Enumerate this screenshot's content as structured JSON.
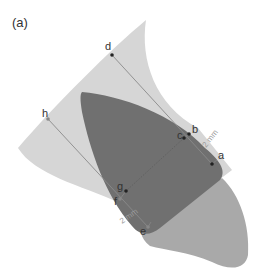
{
  "panel_label": "(a)",
  "colors": {
    "outer_region": "#d6d6d6",
    "inner_dark": "#707070",
    "lower_tip": "#a9a9a9",
    "line": "#8a8a8a",
    "point": "#222222",
    "text": "#333333",
    "dimension_text": "#9a9a9a"
  },
  "points": [
    {
      "id": "a",
      "label": "a"
    },
    {
      "id": "b",
      "label": "b"
    },
    {
      "id": "c",
      "label": "c"
    },
    {
      "id": "d",
      "label": "d"
    },
    {
      "id": "e",
      "label": "e"
    },
    {
      "id": "f",
      "label": "f"
    },
    {
      "id": "g",
      "label": "g"
    },
    {
      "id": "h",
      "label": "h"
    }
  ],
  "dimensions": [
    {
      "id": "upper",
      "label": "2 mm"
    },
    {
      "id": "lower",
      "label": "2 mm"
    }
  ]
}
